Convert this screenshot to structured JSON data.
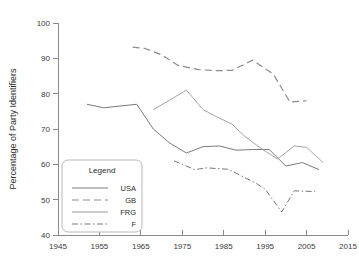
{
  "chart_data": {
    "type": "line",
    "title": "",
    "xlabel": "",
    "ylabel": "Percentage of Party Identifiers",
    "xlim": [
      1945,
      2015
    ],
    "ylim": [
      40,
      100
    ],
    "grid": false,
    "legend_position": "lower-left",
    "legend_title": "Legend",
    "xticks": [
      1945,
      1955,
      1965,
      1975,
      1985,
      1995,
      2005,
      2015
    ],
    "yticks": [
      40,
      50,
      60,
      70,
      80,
      90,
      100
    ],
    "series": [
      {
        "name": "USA",
        "style": "solid",
        "color": "#7a7a7a",
        "x": [
          1952,
          1956,
          1960,
          1964,
          1968,
          1972,
          1976,
          1980,
          1984,
          1988,
          1992,
          1996,
          2000,
          2004,
          2008
        ],
        "values": [
          77.0,
          76.0,
          76.5,
          77.0,
          70.0,
          66.0,
          63.2,
          65.0,
          65.2,
          64.0,
          64.2,
          64.2,
          59.5,
          60.5,
          58.5
        ]
      },
      {
        "name": "GB",
        "style": "dashed",
        "color": "#8c8c8c",
        "x": [
          1963,
          1966,
          1970,
          1974,
          1979,
          1983,
          1987,
          1992,
          1997,
          2001,
          2005
        ],
        "values": [
          93.2,
          92.8,
          91.0,
          88.0,
          86.8,
          86.5,
          86.6,
          89.5,
          85.5,
          77.6,
          78.0
        ]
      },
      {
        "name": "FRG",
        "style": "fine",
        "color": "#9a9a9a",
        "x": [
          1968,
          1972,
          1976,
          1980,
          1983,
          1987,
          1990,
          1994,
          1998,
          2002,
          2005,
          2009
        ],
        "values": [
          75.5,
          78.2,
          81.0,
          75.5,
          73.6,
          71.4,
          68.0,
          64.5,
          61.5,
          65.2,
          64.8,
          60.5
        ]
      },
      {
        "name": "F",
        "style": "dashdot",
        "color": "#777777",
        "x": [
          1973,
          1978,
          1981,
          1986,
          1988,
          1993,
          1995,
          1999,
          2002,
          2007
        ],
        "values": [
          61.0,
          58.5,
          59.0,
          58.6,
          57.5,
          54.5,
          53.0,
          46.5,
          52.5,
          52.3
        ]
      }
    ]
  },
  "legend": {
    "title": "Legend",
    "entries": [
      {
        "label": "USA"
      },
      {
        "label": "GB"
      },
      {
        "label": "FRG"
      },
      {
        "label": "F"
      }
    ]
  },
  "axes": {
    "y_title": "Percentage of Party Identifiers",
    "y_labels": [
      "100",
      "90",
      "80",
      "70",
      "60",
      "50",
      "40"
    ],
    "x_labels": [
      "1945",
      "1955",
      "1965",
      "1975",
      "1985",
      "1995",
      "2005",
      "2015"
    ]
  }
}
